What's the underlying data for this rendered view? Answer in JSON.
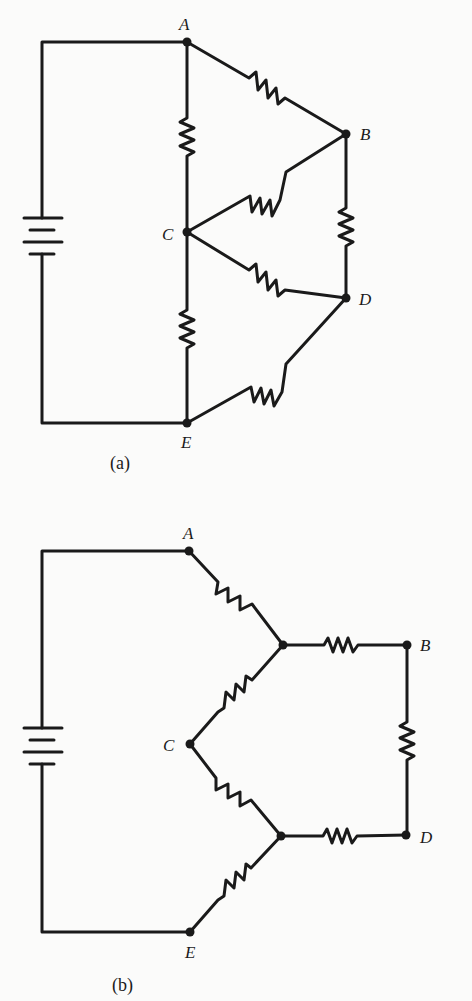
{
  "figure": {
    "panels": [
      {
        "id": "a",
        "caption": "(a)",
        "description": "Bridge network of five resistors with battery between nodes A and E",
        "nodes": [
          {
            "name": "A",
            "label": "A"
          },
          {
            "name": "B",
            "label": "B"
          },
          {
            "name": "C",
            "label": "C"
          },
          {
            "name": "D",
            "label": "D"
          },
          {
            "name": "E",
            "label": "E"
          }
        ],
        "resistors": [
          {
            "from": "A",
            "to": "B"
          },
          {
            "from": "A",
            "to": "C"
          },
          {
            "from": "B",
            "to": "C"
          },
          {
            "from": "B",
            "to": "D"
          },
          {
            "from": "C",
            "to": "D"
          },
          {
            "from": "C",
            "to": "E"
          },
          {
            "from": "D",
            "to": "E"
          }
        ],
        "source": {
          "type": "battery",
          "between": [
            "A",
            "E"
          ]
        }
      },
      {
        "id": "b",
        "caption": "(b)",
        "description": "Equivalent network after delta-to-wye transformation",
        "nodes": [
          {
            "name": "A",
            "label": "A"
          },
          {
            "name": "B",
            "label": "B"
          },
          {
            "name": "C",
            "label": "C"
          },
          {
            "name": "D",
            "label": "D"
          },
          {
            "name": "E",
            "label": "E"
          }
        ],
        "source": {
          "type": "battery",
          "between": [
            "A",
            "E"
          ]
        }
      }
    ]
  }
}
